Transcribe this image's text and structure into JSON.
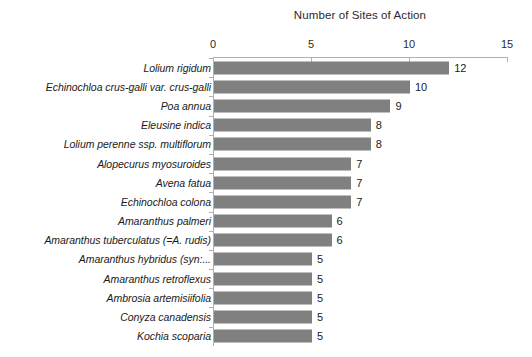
{
  "chart_data": {
    "type": "bar",
    "orientation": "horizontal",
    "title": "Number of Sites of Action",
    "xlabel": "",
    "ylabel": "",
    "xlim": [
      0,
      15
    ],
    "xticks": [
      0,
      5,
      10,
      15
    ],
    "xtick_labels": [
      "0",
      "5",
      "10",
      "15"
    ],
    "grid": false,
    "legend": null,
    "bar_color": "#808080",
    "axis_color": "#b0b0b0",
    "categories": [
      "Lolium rigidum",
      "Echinochloa crus-galli var. crus-galli",
      "Poa annua",
      "Eleusine indica",
      "Lolium perenne ssp. multiflorum",
      "Alopecurus myosuroides",
      "Avena fatua",
      "Echinochloa colona",
      "Amaranthus palmeri",
      "Amaranthus tuberculatus (=A. rudis)",
      "Amaranthus hybridus (syn:...",
      "Amaranthus retroflexus",
      "Ambrosia artemisiifolia",
      "Conyza canadensis",
      "Kochia scoparia"
    ],
    "values": [
      12,
      10,
      9,
      8,
      8,
      7,
      7,
      7,
      6,
      6,
      5,
      5,
      5,
      5,
      5
    ],
    "value_labels": [
      "12",
      "10",
      "9",
      "8",
      "8",
      "7",
      "7",
      "7",
      "6",
      "6",
      "5",
      "5",
      "5",
      "5",
      "5"
    ]
  }
}
